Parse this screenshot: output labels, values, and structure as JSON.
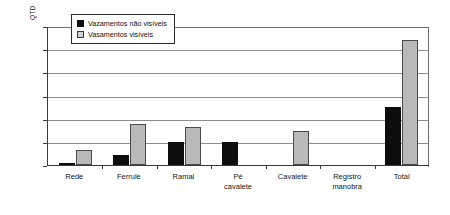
{
  "chart_data": {
    "type": "bar",
    "title": "",
    "xlabel": "",
    "ylabel": "QTD",
    "ylim": [
      0,
      1200
    ],
    "yticks": [
      0,
      200,
      400,
      600,
      800,
      1000,
      1200
    ],
    "grid": true,
    "legend_position": "top-left",
    "categories": [
      "Rede",
      "Ferrule",
      "Ramal",
      "Pé cavalete",
      "Cavalete",
      "Registro manobra",
      "Total"
    ],
    "category_lines": [
      [
        "Rede"
      ],
      [
        "Ferrule"
      ],
      [
        "Ramal"
      ],
      [
        "Pé",
        "cavalete"
      ],
      [
        "Cavalete"
      ],
      [
        "Registro",
        "manobra"
      ],
      [
        "Total"
      ]
    ],
    "series": [
      {
        "name": "Vazamentos não visíveis",
        "color": "#0d0d0d",
        "values": [
          10,
          85,
          195,
          200,
          0,
          0,
          505
        ]
      },
      {
        "name": "Vasamentos visíveis",
        "color": "#b9b9b9",
        "values": [
          130,
          350,
          325,
          0,
          290,
          0,
          1075
        ]
      }
    ]
  },
  "legend": {
    "items": [
      {
        "label": "Vazamentos não visíveis",
        "swatch": "filled-black-square"
      },
      {
        "label": "Vasamentos visíveis",
        "swatch": "outlined-gray-square"
      }
    ]
  },
  "axis": {
    "y_title": "QTD",
    "y_tick_labels": [
      "1200",
      "1000",
      "800",
      "600",
      "400",
      "200",
      "0"
    ]
  }
}
